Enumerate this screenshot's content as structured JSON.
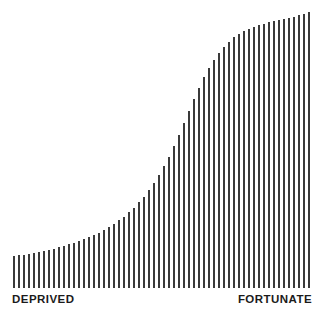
{
  "chart_data": {
    "type": "bar",
    "title": "",
    "subtitle": "",
    "xlabel": "",
    "ylabel": "",
    "grid": false,
    "legend": null,
    "bar_color": "#3a3a3a",
    "background_color": "#ffffff",
    "axis_range_note": "Values are normalized 0-1 relative to the tallest bar; baseline at bottom of plot.",
    "ylim": [
      0,
      1
    ],
    "annotations": [
      {
        "name": "left-axis-label",
        "text": "DEPRIVED",
        "position": "bottom-left"
      },
      {
        "name": "right-axis-label",
        "text": "FORTUNATE",
        "position": "bottom-right"
      }
    ],
    "categories": [
      "1",
      "2",
      "3",
      "4",
      "5",
      "6",
      "7",
      "8",
      "9",
      "10",
      "11",
      "12",
      "13",
      "14",
      "15",
      "16",
      "17",
      "18",
      "19",
      "20",
      "21",
      "22",
      "23",
      "24",
      "25",
      "26",
      "27",
      "28",
      "29",
      "30",
      "31",
      "32",
      "33",
      "34",
      "35",
      "36",
      "37",
      "38",
      "39",
      "40",
      "41",
      "42",
      "43",
      "44",
      "45",
      "46",
      "47",
      "48",
      "49",
      "50",
      "51",
      "52",
      "53",
      "54",
      "55",
      "56",
      "57",
      "58",
      "59",
      "60"
    ],
    "values": [
      0.115,
      0.118,
      0.121,
      0.124,
      0.128,
      0.131,
      0.135,
      0.139,
      0.143,
      0.148,
      0.153,
      0.158,
      0.164,
      0.17,
      0.177,
      0.184,
      0.192,
      0.201,
      0.21,
      0.221,
      0.232,
      0.245,
      0.259,
      0.274,
      0.291,
      0.31,
      0.331,
      0.354,
      0.38,
      0.409,
      0.441,
      0.476,
      0.514,
      0.555,
      0.598,
      0.641,
      0.684,
      0.725,
      0.763,
      0.797,
      0.827,
      0.853,
      0.875,
      0.893,
      0.908,
      0.921,
      0.931,
      0.94,
      0.947,
      0.953,
      0.958,
      0.963,
      0.967,
      0.971,
      0.975,
      0.979,
      0.983,
      0.988,
      0.993,
      1.0
    ]
  },
  "labels": {
    "left": "DEPRIVED",
    "right": "FORTUNATE"
  },
  "layout": {
    "bar_width_px": 2,
    "bar_pitch_px": 5,
    "plot_left_px": 13,
    "plot_baseline_px": 288,
    "plot_top_px": 12
  }
}
